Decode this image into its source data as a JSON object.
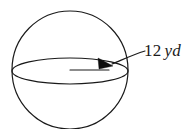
{
  "figure": {
    "kind": "sphere-radius-diagram",
    "shape_name": "sphere",
    "background_color": "#ffffff",
    "stroke_color": "#1a1a1a",
    "arrow_fill_color": "#0d0d0d"
  },
  "label": {
    "full_text": "12 yd",
    "value": "12",
    "unit": "yd",
    "measures": "radius"
  },
  "geometry": {
    "sphere_center_x": 70,
    "sphere_center_y": 70,
    "sphere_radius_x": 58,
    "sphere_radius_y": 59,
    "equator_rx": 58,
    "equator_ry": 13,
    "radius_arrow_start_x": 70,
    "radius_arrow_start_y": 70,
    "radius_arrow_tip_x": 113,
    "radius_arrow_tip_y": 64,
    "leader_start_x": 113,
    "leader_start_y": 63,
    "leader_end_x": 144,
    "leader_end_y": 51
  }
}
